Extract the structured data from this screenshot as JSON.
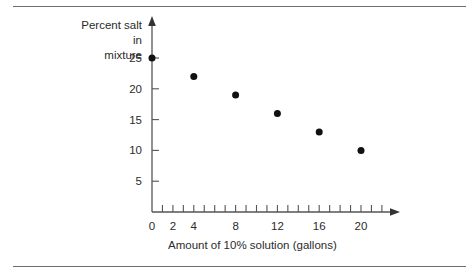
{
  "figure": {
    "background_color": "#ffffff",
    "ink_color": "#2b2b2b",
    "rule_color": "#6e6e6e"
  },
  "chart_data": {
    "type": "scatter",
    "title": "",
    "xlabel": "Amount of 10% solution (gallons)",
    "ylabel": "Percent salt in mixture",
    "ylabel_lines": [
      "Percent salt",
      "in",
      "mixture"
    ],
    "x": [
      0,
      4,
      8,
      12,
      16,
      20
    ],
    "values": [
      25,
      22,
      19,
      16,
      13,
      10
    ],
    "points": [
      {
        "x": 0,
        "y": 25
      },
      {
        "x": 4,
        "y": 22
      },
      {
        "x": 8,
        "y": 19
      },
      {
        "x": 12,
        "y": 16
      },
      {
        "x": 16,
        "y": 13
      },
      {
        "x": 20,
        "y": 10
      }
    ],
    "xlim": [
      0,
      23
    ],
    "ylim": [
      0,
      28
    ],
    "xticks": [
      0,
      1,
      2,
      3,
      4,
      5,
      6,
      7,
      8,
      9,
      10,
      11,
      12,
      13,
      14,
      15,
      16,
      17,
      18,
      19,
      20,
      21,
      22
    ],
    "xtick_labels": [
      {
        "value": 0,
        "label": "0"
      },
      {
        "value": 2,
        "label": "2"
      },
      {
        "value": 4,
        "label": "4"
      },
      {
        "value": 8,
        "label": "8"
      },
      {
        "value": 12,
        "label": "12"
      },
      {
        "value": 16,
        "label": "16"
      },
      {
        "value": 20,
        "label": "20"
      }
    ],
    "yticks": [
      5,
      10,
      15,
      20,
      25
    ],
    "ytick_labels": [
      "5",
      "10",
      "15",
      "20",
      "25"
    ],
    "grid": false,
    "legend": null,
    "marker": "filled-circle",
    "marker_color": "#111111",
    "axis_arrows": true
  }
}
